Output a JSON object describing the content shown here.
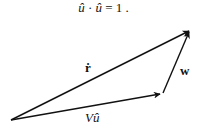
{
  "equation": {
    "lhs_a": "û",
    "dot": " · ",
    "lhs_b": "û",
    "rest": " = 1 ."
  },
  "diagram": {
    "vectors": [
      {
        "name": "r-dot",
        "label": "ṙ",
        "from": [
          11,
          120
        ],
        "to": [
          190,
          30
        ]
      },
      {
        "name": "V-u-hat",
        "label": "Vû",
        "from": [
          11,
          120
        ],
        "to": [
          163,
          93
        ]
      },
      {
        "name": "w",
        "label": "w",
        "from": [
          163,
          93
        ],
        "to": [
          190,
          30
        ]
      }
    ],
    "labels": {
      "r_dot": "ṙ",
      "V_u_hat_V": "V",
      "V_u_hat_u": "û",
      "w": "w"
    },
    "stroke_color": "#111111"
  }
}
